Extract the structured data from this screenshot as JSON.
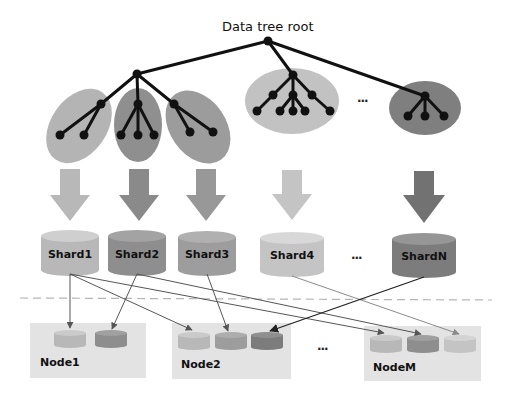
{
  "title": "Data tree root",
  "subtrees": [
    {
      "id": "subtree-1",
      "color": "#b4b4b4"
    },
    {
      "id": "subtree-2",
      "color": "#8f8f8f"
    },
    {
      "id": "subtree-3",
      "color": "#9c9c9c"
    },
    {
      "id": "subtree-4",
      "color": "#c2c2c2"
    },
    {
      "id": "subtree-n",
      "color": "#7f7f7f"
    }
  ],
  "subtree_ellipsis": "...",
  "shards": [
    {
      "label": "Shard1",
      "color": "#b8b8b8"
    },
    {
      "label": "Shard2",
      "color": "#8e8e8e"
    },
    {
      "label": "Shard3",
      "color": "#9d9d9d"
    },
    {
      "label": "Shard4",
      "color": "#c4c4c4"
    },
    {
      "label": "ShardN",
      "color": "#7c7c7c"
    }
  ],
  "shard_ellipsis": "...",
  "nodes": [
    {
      "label": "Node1",
      "replicas": [
        "Shard1",
        "Shard2"
      ]
    },
    {
      "label": "Node2",
      "replicas": [
        "Shard1",
        "Shard3",
        "ShardN"
      ]
    },
    {
      "label": "NodeM",
      "replicas": [
        "Shard1",
        "Shard2",
        "Shard4"
      ]
    }
  ],
  "node_ellipsis": "..."
}
